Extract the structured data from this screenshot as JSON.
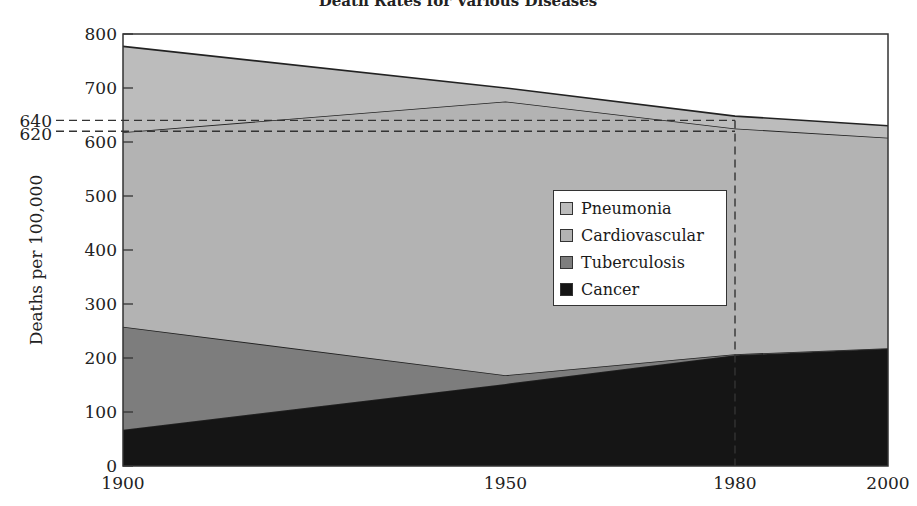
{
  "chart_data": {
    "type": "area",
    "stacked": true,
    "title": "Death Rates for Various Diseases",
    "xlabel": "",
    "ylabel": "Deaths per 100,000",
    "x": [
      1900,
      1950,
      1980,
      2000
    ],
    "x_ticks": [
      "1900",
      "1950",
      "1980",
      "2000"
    ],
    "y_ticks": [
      0,
      100,
      200,
      300,
      400,
      500,
      600,
      700,
      800
    ],
    "ylim": [
      0,
      800
    ],
    "xlim": [
      1900,
      2000
    ],
    "grid": false,
    "legend_position": "inside-right-center",
    "series": [
      {
        "name": "Cancer",
        "color": "#151515",
        "cumulative_top": [
          67,
          152,
          205,
          217
        ],
        "values": [
          67,
          152,
          205,
          217
        ]
      },
      {
        "name": "Tuberculosis",
        "color": "#7d7d7d",
        "cumulative_top": [
          258,
          168,
          207,
          218
        ],
        "values": [
          191,
          16,
          2,
          1
        ]
      },
      {
        "name": "Cardiovascular",
        "color": "#b3b3b3",
        "cumulative_top": [
          618,
          675,
          625,
          608
        ],
        "values": [
          360,
          507,
          418,
          390
        ]
      },
      {
        "name": "Pneumonia",
        "color": "#bcbcbc",
        "cumulative_top": [
          777,
          700,
          648,
          630
        ],
        "values": [
          159,
          25,
          23,
          22
        ]
      }
    ],
    "annotations": [
      {
        "type": "hline-dashed",
        "value": 640,
        "label": "640",
        "x_to": 1980
      },
      {
        "type": "hline-dashed",
        "value": 620,
        "label": "620",
        "x_to": 1980
      },
      {
        "type": "vline-dashed",
        "value": 1980
      }
    ]
  },
  "legend": {
    "items": [
      {
        "label": "Pneumonia",
        "color": "#bcbcbc"
      },
      {
        "label": "Cardiovascular",
        "color": "#b3b3b3"
      },
      {
        "label": "Tuberculosis",
        "color": "#7d7d7d"
      },
      {
        "label": "Cancer",
        "color": "#151515"
      }
    ]
  },
  "labels": {
    "title": "Death Rates for Various Diseases",
    "ylabel": "Deaths per 100,000",
    "ann_640": "640",
    "ann_620": "620"
  }
}
